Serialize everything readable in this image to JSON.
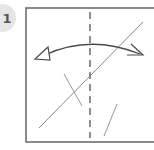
{
  "step": {
    "number": "1",
    "badge_color": "#e6e6e6",
    "text_color": "#555555"
  },
  "diagram": {
    "type": "origami-fold-instruction",
    "colors": {
      "border": "#6e6e6e",
      "line": "#7a7a7a",
      "dashed": "#555555",
      "arrow": "#4a4a4a"
    },
    "paper": {
      "x": 26,
      "y": 8,
      "width": 140,
      "height": 134
    },
    "valley_fold_line": {
      "x": 90,
      "y1": 12,
      "y2": 138,
      "dash": "7,5"
    },
    "diagonal_crease": {
      "x1": 39,
      "y1": 128,
      "x2": 143,
      "y2": 22
    },
    "short_strokes": [
      {
        "x1": 64,
        "y1": 74,
        "x2": 82,
        "y2": 106
      },
      {
        "x1": 104,
        "y1": 136,
        "x2": 117,
        "y2": 104
      }
    ],
    "fold_arrow": {
      "path": "M 45 55 Q 90 34 140 54",
      "left_head": "hollow-triangle",
      "right_head": "open-half-arrow"
    }
  }
}
